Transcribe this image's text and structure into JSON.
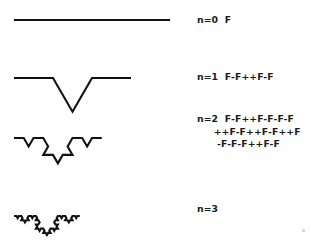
{
  "figure": {
    "background_color": "#ffffff",
    "stroke_color": "#111111",
    "text_color": "#1b1b1b"
  },
  "chart_data": {
    "type": "line",
    "xlabel": "",
    "ylabel": "",
    "grid": false,
    "legend_position": "right",
    "axiom": "F",
    "production_rule": "F -> F-F++F-F",
    "angle_degrees": 60,
    "series": [
      {
        "name": "n=0",
        "iteration": 0,
        "segments": 1,
        "baseline_y": 20,
        "x_start": 14,
        "x_end": 170,
        "peak_y": 20,
        "string": "F"
      },
      {
        "name": "n=1",
        "iteration": 1,
        "segments": 4,
        "baseline_y": 78,
        "x_start": 14,
        "x_end": 170,
        "peak_y": 33,
        "string": "F-F++F-F"
      },
      {
        "name": "n=2",
        "iteration": 2,
        "segments": 16,
        "baseline_y": 138,
        "x_start": 14,
        "x_end": 170,
        "peak_y": 108,
        "string": "F-F++F-F-F-F++F-F++F-F++F-F-F-F++F-F"
      },
      {
        "name": "n=3",
        "iteration": 3,
        "segments": 64,
        "baseline_y": 216,
        "x_start": 14,
        "x_end": 170,
        "peak_y": 180,
        "string": "n=3"
      }
    ]
  },
  "labels": {
    "n0": {
      "order": "n=0",
      "rule": "F",
      "full": "n=0  F"
    },
    "n1": {
      "order": "n=1",
      "rule": "F-F++F-F",
      "full": "n=1  F-F++F-F"
    },
    "n2": {
      "order": "n=2",
      "rule_line1": "F-F++F-F-F-F",
      "rule_line2": "++F-F++F-F++F",
      "rule_line3": "-F-F-F++F-F",
      "full": "n=2  F-F++F-F-F-F\n     ++F-F++F-F++F\n      -F-F-F++F-F"
    },
    "n3": {
      "order": "n=3",
      "rule": "",
      "full": "n=3"
    }
  }
}
